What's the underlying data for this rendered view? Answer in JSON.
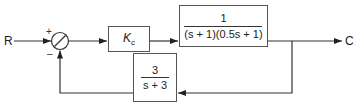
{
  "diagram": {
    "type": "feedback-control-block-diagram",
    "input_label": "R",
    "output_label": "C",
    "summing_junction": {
      "plus_sign": "+",
      "minus_sign": "–"
    },
    "controller_block": {
      "symbol": "K",
      "subscript": "c"
    },
    "plant_block": {
      "numerator": "1",
      "denominator": "(s + 1)(0.5s + 1)"
    },
    "feedback_block": {
      "numerator": "3",
      "denominator": "s + 3"
    },
    "colors": {
      "line": "#333333",
      "box_border": "#555555",
      "text": "#222222"
    }
  }
}
